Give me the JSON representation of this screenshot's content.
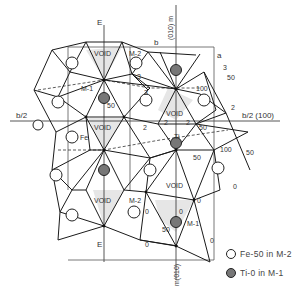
{
  "figure": {
    "type": "crystal-structure-projection",
    "axes": {
      "E_top": "E",
      "E_bottom": "E",
      "mirror_top": "(010) m",
      "mirror_bottom": "m(010)",
      "b_half_left": "b/2",
      "b_half_right": "b/2 (100)",
      "b_axis": "b",
      "a_axis": "a"
    },
    "site_labels": {
      "void_1": "VOID",
      "void_2": "VOID",
      "void_3": "VOID",
      "void_4": "VOID",
      "void_5": "VOID",
      "m2_top": "M-2",
      "m2_bottom": "M-2",
      "m1_left": "M-1",
      "m1_bottom": "M-1",
      "fe": "Fe",
      "ti": "Ti"
    },
    "height_labels": {
      "h50_m1": "50",
      "h3_a": "3",
      "h3_b": "3",
      "h3_c": "3",
      "h50_c": "50",
      "h100_a": "100",
      "h2_a": "2",
      "h2_b": "2",
      "h2_c": "2",
      "h2_d": "2",
      "h50_d": "50",
      "h50_e": "50",
      "h100_b": "100",
      "h50_f": "50",
      "h0_a": "0",
      "h0_b": "0",
      "h0_c": "0",
      "h0_d": "0",
      "h0_e": "0",
      "h0_f": "0",
      "h50_g": "50"
    },
    "legend": [
      {
        "symbol": "open-circle",
        "label": "Fe-50 in M-2"
      },
      {
        "symbol": "shaded-circle",
        "label": "Ti-0 in M-1"
      }
    ]
  }
}
